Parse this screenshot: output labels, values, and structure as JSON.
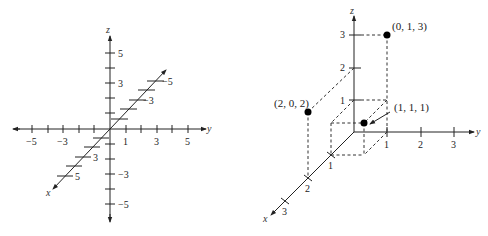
{
  "left_figure": {
    "title": "Coordinate axes in 3-space",
    "axes": {
      "x_label": "x",
      "y_label": "y",
      "z_label": "z"
    },
    "y_tick_labels": [
      "−5",
      "−3",
      "1",
      "3",
      "5"
    ],
    "z_tick_labels": [
      "5",
      "3",
      "−3",
      "−5"
    ],
    "x_tick_labels": [
      "3",
      "5",
      "−3",
      "−5"
    ]
  },
  "right_figure": {
    "title": "Plotted points in 3-space",
    "axes": {
      "x_label": "x",
      "y_label": "y",
      "z_label": "z"
    },
    "x_tick_labels": [
      "1",
      "2",
      "3"
    ],
    "y_tick_labels": [
      "1",
      "2",
      "3"
    ],
    "z_tick_labels": [
      "1",
      "2",
      "3"
    ],
    "points": [
      {
        "label": "(0, 1, 3)",
        "x": 0,
        "y": 1,
        "z": 3
      },
      {
        "label": "(2, 0, 2)",
        "x": 2,
        "y": 0,
        "z": 2
      },
      {
        "label": "(1, 1, 1)",
        "x": 1,
        "y": 1,
        "z": 1
      }
    ]
  }
}
